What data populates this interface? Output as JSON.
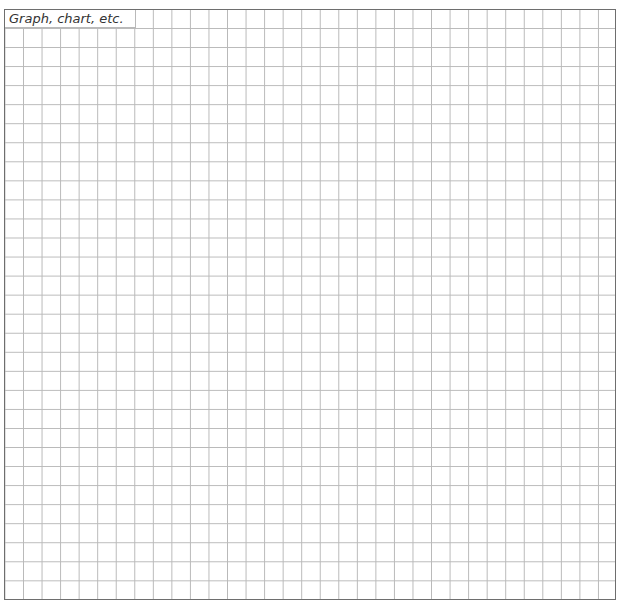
{
  "worksheet": {
    "label": "Graph, chart, etc.",
    "grid": {
      "columns": 33,
      "rows": 31,
      "line_color": "#b9b9b9",
      "border_color": "#6e6e6e"
    }
  }
}
